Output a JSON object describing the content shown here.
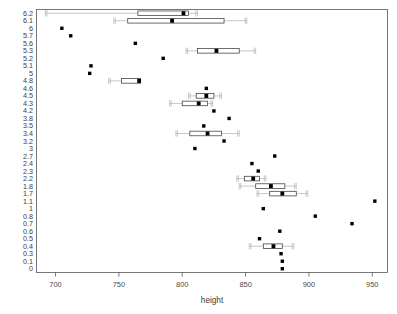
{
  "chart_data": {
    "type": "box",
    "title": "",
    "xlabel": "height",
    "ylabel": "",
    "orientation": "horizontal",
    "xlim": [
      685,
      962
    ],
    "xticks": [
      700,
      750,
      800,
      850,
      900,
      950
    ],
    "xticklabels": [
      "700",
      "750",
      "800",
      "850",
      "900",
      "950"
    ],
    "grid": false,
    "legend": null,
    "categories": [
      "6.2",
      "6.1",
      "6",
      "5.7",
      "5.6",
      "5.3",
      "5.2",
      "5.1",
      "5",
      "4.8",
      "4.6",
      "4.5",
      "4.3",
      "4.2",
      "3.8",
      "3.5",
      "3.4",
      "3.2",
      "3",
      "2.7",
      "2.4",
      "2.3",
      "2.2",
      "1.8",
      "1.7",
      "1.1",
      "1",
      "0.8",
      "0.7",
      "0.6",
      "0.5",
      "0.4",
      "0.3",
      "0.1",
      "0"
    ],
    "rows": [
      {
        "category": "6.2",
        "kind": "box",
        "min": 692,
        "q1": 765,
        "median": 801,
        "q3": 805,
        "max": 812,
        "outliers": []
      },
      {
        "category": "6.1",
        "kind": "box",
        "min": 746,
        "q1": 757,
        "median": 792,
        "q3": 833,
        "max": 851,
        "outliers": []
      },
      {
        "category": "6",
        "kind": "point",
        "value": 705
      },
      {
        "category": "5.7",
        "kind": "point",
        "value": 712
      },
      {
        "category": "5.6",
        "kind": "point",
        "value": 763
      },
      {
        "category": "5.3",
        "kind": "box",
        "min": 803,
        "q1": 812,
        "median": 827,
        "q3": 845,
        "max": 858,
        "outliers": []
      },
      {
        "category": "5.2",
        "kind": "point",
        "value": 785
      },
      {
        "category": "5.1",
        "kind": "point",
        "value": 728
      },
      {
        "category": "5",
        "kind": "point",
        "value": 727
      },
      {
        "category": "4.8",
        "kind": "box",
        "min": 742,
        "q1": 752,
        "median": 766,
        "q3": 767,
        "max": 767,
        "outliers": []
      },
      {
        "category": "4.6",
        "kind": "point",
        "value": 819
      },
      {
        "category": "4.5",
        "kind": "box",
        "min": 805,
        "q1": 811,
        "median": 819,
        "q3": 825,
        "max": 831,
        "outliers": []
      },
      {
        "category": "4.3",
        "kind": "box",
        "min": 790,
        "q1": 800,
        "median": 813,
        "q3": 820,
        "max": 824,
        "outliers": []
      },
      {
        "category": "4.2",
        "kind": "point",
        "value": 825
      },
      {
        "category": "3.8",
        "kind": "point",
        "value": 837
      },
      {
        "category": "3.5",
        "kind": "point",
        "value": 817
      },
      {
        "category": "3.4",
        "kind": "box",
        "min": 795,
        "q1": 806,
        "median": 820,
        "q3": 831,
        "max": 845,
        "outliers": []
      },
      {
        "category": "3.2",
        "kind": "point",
        "value": 833
      },
      {
        "category": "3",
        "kind": "point",
        "value": 810
      },
      {
        "category": "2.7",
        "kind": "point",
        "value": 873
      },
      {
        "category": "2.4",
        "kind": "point",
        "value": 855
      },
      {
        "category": "2.3",
        "kind": "point",
        "value": 860
      },
      {
        "category": "2.2",
        "kind": "box",
        "min": 843,
        "q1": 849,
        "median": 856,
        "q3": 861,
        "max": 866,
        "outliers": []
      },
      {
        "category": "1.8",
        "kind": "box",
        "min": 845,
        "q1": 858,
        "median": 870,
        "q3": 881,
        "max": 890,
        "outliers": []
      },
      {
        "category": "1.7",
        "kind": "box",
        "min": 859,
        "q1": 869,
        "median": 879,
        "q3": 890,
        "max": 899,
        "outliers": []
      },
      {
        "category": "1.1",
        "kind": "point",
        "value": 952
      },
      {
        "category": "1",
        "kind": "point",
        "value": 864
      },
      {
        "category": "0.8",
        "kind": "point",
        "value": 905
      },
      {
        "category": "0.7",
        "kind": "point",
        "value": 934
      },
      {
        "category": "0.6",
        "kind": "point",
        "value": 877
      },
      {
        "category": "0.5",
        "kind": "point",
        "value": 861
      },
      {
        "category": "0.4",
        "kind": "box",
        "min": 853,
        "q1": 864,
        "median": 872,
        "q3": 879,
        "max": 888,
        "outliers": []
      },
      {
        "category": "0.3",
        "kind": "point",
        "value": 878
      },
      {
        "category": "0.1",
        "kind": "point",
        "value": 879
      },
      {
        "category": "0",
        "kind": "point",
        "value": 879
      }
    ]
  },
  "axis": {
    "x_title": "height"
  }
}
